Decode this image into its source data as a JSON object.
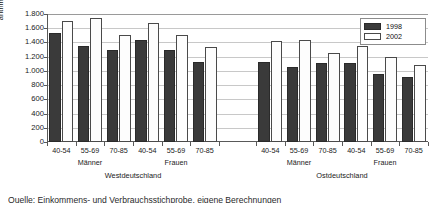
{
  "chart_data": {
    "type": "bar",
    "title": "",
    "xlabel": "",
    "ylabel": "arithm. Mittelwert in €",
    "ylim": [
      0,
      1800
    ],
    "ytick_step": 200,
    "grid": true,
    "legend_position": "top-right",
    "ytick_labels": [
      "1.800",
      "1.600",
      "1.400",
      "1.200",
      "1.000",
      "800",
      "600",
      "400",
      "200",
      "0"
    ],
    "ytick_values": [
      1800,
      1600,
      1400,
      1200,
      1000,
      800,
      600,
      400,
      200,
      0
    ],
    "categories": [
      "40-54",
      "55-69",
      "70-85",
      "40-54",
      "55-69",
      "70-85",
      "40-54",
      "55-69",
      "70-85",
      "40-54",
      "55-69",
      "70-85"
    ],
    "groups": [
      {
        "region": "Westdeutschland",
        "sexes": [
          {
            "label": "Männer",
            "ages": [
              "40-54",
              "55-69",
              "70-85"
            ]
          },
          {
            "label": "Frauen",
            "ages": [
              "40-54",
              "55-69",
              "70-85"
            ]
          }
        ]
      },
      {
        "region": "Ostdeutschland",
        "sexes": [
          {
            "label": "Männer",
            "ages": [
              "40-54",
              "55-69",
              "70-85"
            ]
          },
          {
            "label": "Frauen",
            "ages": [
              "40-54",
              "55-69",
              "70-85"
            ]
          }
        ]
      }
    ],
    "series": [
      {
        "name": "1998",
        "color": "#3a3a3a",
        "values": [
          1530,
          1350,
          1300,
          1430,
          1300,
          1120,
          1120,
          1050,
          1110,
          1110,
          960,
          910
        ]
      },
      {
        "name": "2002",
        "color": "#ffffff",
        "values": [
          1700,
          1750,
          1500,
          1680,
          1505,
          1340,
          1420,
          1430,
          1245,
          1350,
          1190,
          1080
        ]
      }
    ]
  },
  "legend": {
    "items": [
      {
        "label": "1998",
        "swatch": "dark"
      },
      {
        "label": "2002",
        "swatch": "white"
      }
    ]
  },
  "axis": {
    "y_title": "arithm. Mittelwert in €"
  },
  "caption": {
    "text": "Quelle: Einkommens- und Verbrauchsstichprobe, eigene Berechnungen"
  }
}
